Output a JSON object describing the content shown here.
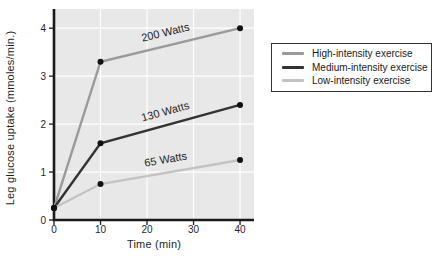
{
  "chart_data": {
    "type": "line",
    "title": "",
    "xlabel": "Time (min)",
    "ylabel": "Leg glucose uptake (mmoles/min.)",
    "x": [
      0,
      10,
      40
    ],
    "x_ticks": [
      0,
      10,
      20,
      30,
      40
    ],
    "y_ticks": [
      0,
      1,
      2,
      3,
      4
    ],
    "xlim": [
      0,
      43
    ],
    "ylim": [
      0,
      4.4
    ],
    "grid": true,
    "legend_position": "right",
    "series": [
      {
        "name": "High-intensity exercise",
        "line_label": "200 Watts",
        "values": [
          0.25,
          3.3,
          4.0
        ],
        "color": "#9a9a9a"
      },
      {
        "name": "Medium-intensity exercise",
        "line_label": "130 Watts",
        "values": [
          0.25,
          1.6,
          2.4
        ],
        "color": "#333333"
      },
      {
        "name": "Low-intensity exercise",
        "line_label": "65 Watts",
        "values": [
          0.25,
          0.75,
          1.25
        ],
        "color": "#c3c3c3"
      }
    ],
    "colors": {
      "plot_background": "#e8e8e8",
      "grid": "#ffffff",
      "axis": "#1a1a1a",
      "marker": "#111111",
      "text": "#1f1f1f"
    }
  }
}
